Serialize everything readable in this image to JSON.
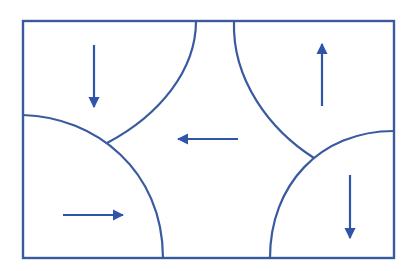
{
  "diagram": {
    "title": "",
    "stroke_color": "#3a5aa0",
    "arrow_color": "#2f55a8",
    "background": "#ffffff",
    "frame": {
      "x": 23,
      "y": 21,
      "width": 371,
      "height": 237
    },
    "regions": [
      {
        "id": "top-left",
        "arrow": "down"
      },
      {
        "id": "top-right",
        "arrow": "up"
      },
      {
        "id": "center",
        "arrow": "left"
      },
      {
        "id": "bottom-left",
        "arrow": "right"
      },
      {
        "id": "bottom-right",
        "arrow": "down"
      }
    ]
  }
}
